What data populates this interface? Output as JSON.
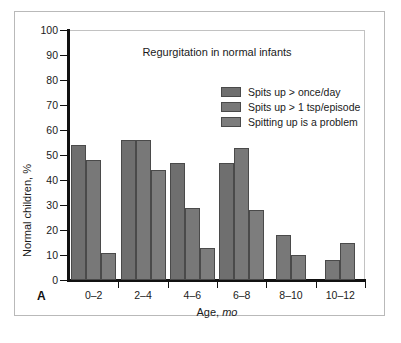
{
  "figure": {
    "panel_label": "A"
  },
  "chart_data": {
    "type": "bar",
    "title": "Regurgitation in normal infants",
    "xlabel": "Age, mo",
    "xlabel_plain": "Age,",
    "xlabel_italic": "mo",
    "ylabel": "Normal children, %",
    "categories": [
      "0–2",
      "2–4",
      "4–6",
      "6–8",
      "8–10",
      "10–12"
    ],
    "ylim": [
      0,
      100
    ],
    "ytick_values": [
      0,
      10,
      20,
      30,
      40,
      50,
      60,
      70,
      80,
      90,
      100
    ],
    "ytick_labels": [
      "0",
      "10",
      "20",
      "30",
      "40",
      "50",
      "60",
      "70",
      "80",
      "90",
      "100"
    ],
    "grid": false,
    "legend_position": "upper-center-right",
    "series": [
      {
        "name": "Spits up > once/day",
        "color": "#6f6f6f",
        "values": [
          54,
          56,
          47,
          47,
          null,
          null
        ]
      },
      {
        "name": "Spits up > 1 tsp/episode",
        "color": "#787878",
        "values": [
          48,
          56,
          29,
          53,
          18,
          8
        ]
      },
      {
        "name": "Spitting up is a problem",
        "color": "#7d7d7d",
        "values": [
          11,
          44,
          13,
          28,
          10,
          15
        ]
      }
    ]
  }
}
